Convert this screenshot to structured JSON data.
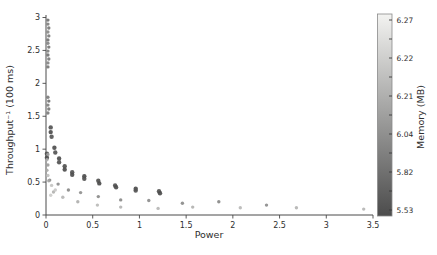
{
  "figure": {
    "background": "#ffffff"
  },
  "chart_data": {
    "type": "scatter",
    "title": "",
    "xlabel": "Power",
    "ylabel": "Throughput⁻¹ (100 ms)",
    "xlim": [
      0,
      3.5
    ],
    "ylim": [
      0,
      3
    ],
    "grid": false,
    "xtick_labels": [
      "0",
      "0.5",
      "1",
      "1.5",
      "2",
      "2.5",
      "3",
      "3.5"
    ],
    "ytick_labels": [
      "0",
      "0.5",
      "1",
      "1.5",
      "2",
      "2.5",
      "3"
    ],
    "colorbar": {
      "label": "Memory (MB)",
      "tick_labels": [
        "6.27",
        "6.22",
        "6.21",
        "6.04",
        "5.82",
        "5.53"
      ],
      "value_min": 5.53,
      "value_max": 6.27,
      "color_top": "#f3f3f1",
      "color_bottom": "#4c4c4c",
      "legend_position": "right"
    },
    "points": [
      {
        "x": 0.02,
        "y": 2.96,
        "mem": 5.7,
        "r": 1.7
      },
      {
        "x": 0.02,
        "y": 2.9,
        "mem": 5.76,
        "r": 1.7
      },
      {
        "x": 0.03,
        "y": 2.84,
        "mem": 5.72,
        "r": 1.7
      },
      {
        "x": 0.02,
        "y": 2.78,
        "mem": 5.8,
        "r": 1.7
      },
      {
        "x": 0.03,
        "y": 2.72,
        "mem": 5.74,
        "r": 1.7
      },
      {
        "x": 0.02,
        "y": 2.66,
        "mem": 5.7,
        "r": 1.7
      },
      {
        "x": 0.02,
        "y": 2.61,
        "mem": 5.78,
        "r": 1.7
      },
      {
        "x": 0.03,
        "y": 2.55,
        "mem": 5.72,
        "r": 1.7
      },
      {
        "x": 0.02,
        "y": 2.49,
        "mem": 5.76,
        "r": 1.7
      },
      {
        "x": 0.02,
        "y": 2.43,
        "mem": 5.7,
        "r": 1.7
      },
      {
        "x": 0.03,
        "y": 2.37,
        "mem": 5.74,
        "r": 1.7
      },
      {
        "x": 0.02,
        "y": 2.31,
        "mem": 5.78,
        "r": 1.7
      },
      {
        "x": 0.02,
        "y": 2.25,
        "mem": 5.72,
        "r": 1.7
      },
      {
        "x": 0.02,
        "y": 1.79,
        "mem": 5.74,
        "r": 1.7
      },
      {
        "x": 0.03,
        "y": 1.73,
        "mem": 5.7,
        "r": 1.7
      },
      {
        "x": 0.02,
        "y": 1.67,
        "mem": 5.76,
        "r": 1.7
      },
      {
        "x": 0.03,
        "y": 1.61,
        "mem": 5.72,
        "r": 1.7
      },
      {
        "x": 0.02,
        "y": 1.55,
        "mem": 5.74,
        "r": 1.7
      },
      {
        "x": 0.01,
        "y": 0.93,
        "mem": 5.55,
        "r": 2.2
      },
      {
        "x": 0.01,
        "y": 0.87,
        "mem": 5.53,
        "r": 2.2
      },
      {
        "x": 0.05,
        "y": 1.33,
        "mem": 5.56,
        "r": 2.2
      },
      {
        "x": 0.05,
        "y": 1.26,
        "mem": 5.53,
        "r": 2.2
      },
      {
        "x": 0.06,
        "y": 1.19,
        "mem": 5.58,
        "r": 2.2
      },
      {
        "x": 0.09,
        "y": 1.02,
        "mem": 5.54,
        "r": 2.2
      },
      {
        "x": 0.1,
        "y": 0.95,
        "mem": 5.57,
        "r": 2.2
      },
      {
        "x": 0.14,
        "y": 0.86,
        "mem": 5.53,
        "r": 2.2
      },
      {
        "x": 0.14,
        "y": 0.8,
        "mem": 5.56,
        "r": 2.2
      },
      {
        "x": 0.2,
        "y": 0.74,
        "mem": 5.55,
        "r": 2.2
      },
      {
        "x": 0.2,
        "y": 0.69,
        "mem": 5.53,
        "r": 2.2
      },
      {
        "x": 0.28,
        "y": 0.65,
        "mem": 5.57,
        "r": 2.2
      },
      {
        "x": 0.28,
        "y": 0.61,
        "mem": 5.54,
        "r": 2.2
      },
      {
        "x": 0.41,
        "y": 0.59,
        "mem": 5.53,
        "r": 2.2
      },
      {
        "x": 0.41,
        "y": 0.55,
        "mem": 5.56,
        "r": 2.2
      },
      {
        "x": 0.56,
        "y": 0.52,
        "mem": 5.55,
        "r": 2.2
      },
      {
        "x": 0.57,
        "y": 0.48,
        "mem": 5.53,
        "r": 2.2
      },
      {
        "x": 0.74,
        "y": 0.45,
        "mem": 5.56,
        "r": 2.2
      },
      {
        "x": 0.75,
        "y": 0.42,
        "mem": 5.54,
        "r": 2.2
      },
      {
        "x": 0.96,
        "y": 0.4,
        "mem": 5.53,
        "r": 2.2
      },
      {
        "x": 0.96,
        "y": 0.37,
        "mem": 5.57,
        "r": 2.2
      },
      {
        "x": 1.21,
        "y": 0.36,
        "mem": 5.55,
        "r": 2.2
      },
      {
        "x": 1.22,
        "y": 0.33,
        "mem": 5.53,
        "r": 2.2
      },
      {
        "x": 0.04,
        "y": 0.53,
        "mem": 5.8,
        "r": 1.7
      },
      {
        "x": 0.13,
        "y": 0.47,
        "mem": 5.82,
        "r": 1.7
      },
      {
        "x": 0.24,
        "y": 0.38,
        "mem": 5.8,
        "r": 1.7
      },
      {
        "x": 0.37,
        "y": 0.34,
        "mem": 5.83,
        "r": 1.7
      },
      {
        "x": 0.56,
        "y": 0.28,
        "mem": 5.81,
        "r": 1.7
      },
      {
        "x": 0.8,
        "y": 0.23,
        "mem": 5.8,
        "r": 1.7
      },
      {
        "x": 1.1,
        "y": 0.22,
        "mem": 5.82,
        "r": 1.7
      },
      {
        "x": 1.46,
        "y": 0.18,
        "mem": 5.81,
        "r": 1.7
      },
      {
        "x": 1.85,
        "y": 0.2,
        "mem": 5.8,
        "r": 1.7
      },
      {
        "x": 2.36,
        "y": 0.15,
        "mem": 5.82,
        "r": 1.7
      },
      {
        "x": 0.08,
        "y": 0.35,
        "mem": 5.98,
        "r": 1.7
      },
      {
        "x": 0.18,
        "y": 0.27,
        "mem": 6.0,
        "r": 1.7
      },
      {
        "x": 0.34,
        "y": 0.2,
        "mem": 5.97,
        "r": 1.7
      },
      {
        "x": 0.55,
        "y": 0.15,
        "mem": 6.02,
        "r": 1.7
      },
      {
        "x": 0.8,
        "y": 0.12,
        "mem": 5.99,
        "r": 1.7
      },
      {
        "x": 1.2,
        "y": 0.1,
        "mem": 6.0,
        "r": 1.7
      },
      {
        "x": 1.57,
        "y": 0.12,
        "mem": 5.98,
        "r": 1.7
      },
      {
        "x": 2.08,
        "y": 0.11,
        "mem": 6.01,
        "r": 1.7
      },
      {
        "x": 2.68,
        "y": 0.11,
        "mem": 5.99,
        "r": 1.7
      },
      {
        "x": 3.4,
        "y": 0.09,
        "mem": 6.0,
        "r": 1.7
      },
      {
        "x": 0.02,
        "y": 0.92,
        "mem": 5.9,
        "r": 1.7
      },
      {
        "x": 0.01,
        "y": 0.84,
        "mem": 5.96,
        "r": 1.7
      },
      {
        "x": 0.02,
        "y": 0.76,
        "mem": 5.88,
        "r": 1.7
      },
      {
        "x": 0.01,
        "y": 0.68,
        "mem": 5.94,
        "r": 1.7
      },
      {
        "x": 0.02,
        "y": 0.6,
        "mem": 6.04,
        "r": 1.7
      },
      {
        "x": 0.03,
        "y": 0.52,
        "mem": 5.92,
        "r": 1.7
      },
      {
        "x": 0.06,
        "y": 0.45,
        "mem": 6.06,
        "r": 1.7
      },
      {
        "x": 0.1,
        "y": 0.38,
        "mem": 6.08,
        "r": 1.7
      },
      {
        "x": 0.05,
        "y": 0.3,
        "mem": 6.1,
        "r": 1.7
      }
    ]
  }
}
